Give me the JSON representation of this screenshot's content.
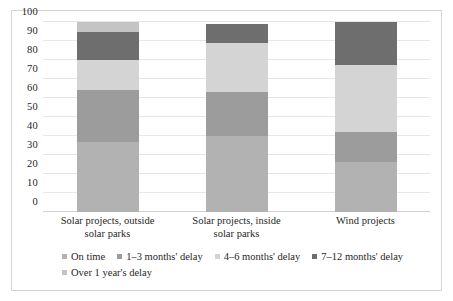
{
  "chart_data": {
    "type": "bar",
    "subtype": "stacked-bar-100",
    "title": "",
    "xlabel": "",
    "ylabel": "",
    "ylim": [
      0,
      100
    ],
    "yticks": [
      0,
      10,
      20,
      30,
      40,
      50,
      60,
      70,
      80,
      90,
      100
    ],
    "ytick_labels": [
      "0",
      "10",
      "20",
      "30",
      "40",
      "50",
      "60",
      "70",
      "80",
      "90",
      "100"
    ],
    "grid": true,
    "legend_position": "bottom",
    "categories": [
      "Solar projects, outside solar parks",
      "Solar projects, inside solar parks",
      "Wind projects"
    ],
    "category_lines": [
      [
        "Solar projects, outside",
        "solar parks"
      ],
      [
        "Solar projects, inside",
        "solar parks"
      ],
      [
        "Wind projects",
        ""
      ]
    ],
    "series": [
      {
        "name": "On time",
        "color": "#b2b2b2",
        "values": [
          37,
          40,
          26.5
        ],
        "cumulative_tops": [
          37,
          40,
          26.5
        ]
      },
      {
        "name": "1–3 months' delay",
        "color": "#9c9c9c",
        "values": [
          27,
          23,
          15.5
        ],
        "cumulative_tops": [
          64,
          63,
          42
        ]
      },
      {
        "name": "4–6 months' delay",
        "color": "#d4d4d4",
        "values": [
          16,
          26,
          35.5
        ],
        "cumulative_tops": [
          80,
          89,
          77.5
        ]
      },
      {
        "name": "7–12 months' delay",
        "color": "#6e6e6e",
        "values": [
          15,
          10,
          22.5
        ],
        "cumulative_tops": [
          95,
          99,
          100
        ]
      },
      {
        "name": "Over 1 year's delay",
        "color": "#c4c4c4",
        "values": [
          5,
          0,
          0
        ],
        "cumulative_tops": [
          100,
          99,
          100
        ]
      }
    ],
    "totals": [
      100,
      99,
      100
    ]
  },
  "legend": {
    "items": [
      {
        "label": "On time",
        "color": "#b2b2b2"
      },
      {
        "label": "1–3 months' delay",
        "color": "#9c9c9c"
      },
      {
        "label": "4–6 months' delay",
        "color": "#d4d4d4"
      },
      {
        "label": "7–12 months' delay",
        "color": "#6e6e6e"
      },
      {
        "label": "Over 1 year's delay",
        "color": "#c4c4c4"
      }
    ]
  },
  "axis": {
    "y_ticks": [
      "100",
      "90",
      "80",
      "70",
      "60",
      "50",
      "40",
      "30",
      "20",
      "10",
      "0"
    ]
  }
}
